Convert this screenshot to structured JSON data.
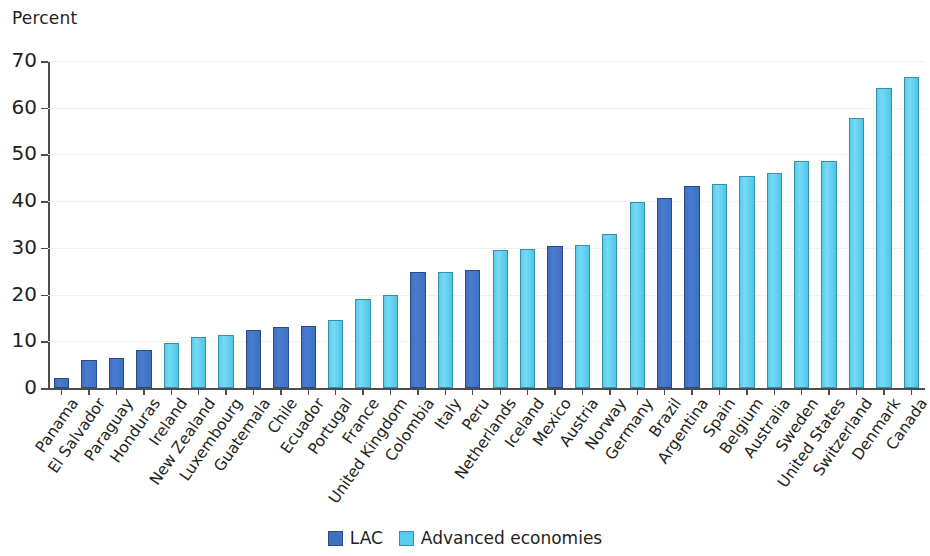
{
  "chart_data": {
    "type": "bar",
    "title": "",
    "subtitle": "",
    "xlabel": "",
    "ylabel": "Percent",
    "ylim": [
      0,
      70
    ],
    "yticks": [
      0,
      10,
      20,
      30,
      40,
      50,
      60,
      70
    ],
    "grid": true,
    "legend_position": "bottom-center",
    "categories": [
      "Panama",
      "El Salvador",
      "Paraguay",
      "Honduras",
      "Ireland",
      "New Zealand",
      "Luxembourg",
      "Guatemala",
      "Chile",
      "Ecuador",
      "Portugal",
      "France",
      "United Kingdom",
      "Colombia",
      "Italy",
      "Peru",
      "Netherlands",
      "Iceland",
      "Mexico",
      "Austria",
      "Norway",
      "Germany",
      "Brazil",
      "Argentina",
      "Spain",
      "Belgium",
      "Australia",
      "Sweden",
      "United States",
      "Switzerland",
      "Denmark",
      "Canada"
    ],
    "values": [
      2.1,
      6.0,
      6.4,
      8.1,
      9.7,
      10.9,
      11.3,
      12.5,
      13.1,
      13.3,
      14.5,
      19.0,
      20.0,
      24.8,
      24.9,
      25.3,
      29.6,
      29.7,
      30.5,
      30.7,
      32.9,
      39.8,
      40.7,
      43.2,
      43.7,
      45.3,
      46.1,
      48.7,
      48.7,
      57.9,
      64.2,
      66.5
    ],
    "groups": [
      "LAC",
      "LAC",
      "LAC",
      "LAC",
      "Advanced economies",
      "Advanced economies",
      "Advanced economies",
      "LAC",
      "LAC",
      "LAC",
      "Advanced economies",
      "Advanced economies",
      "Advanced economies",
      "LAC",
      "Advanced economies",
      "LAC",
      "Advanced economies",
      "Advanced economies",
      "LAC",
      "Advanced economies",
      "Advanced economies",
      "Advanced economies",
      "LAC",
      "LAC",
      "Advanced economies",
      "Advanced economies",
      "Advanced economies",
      "Advanced economies",
      "Advanced economies",
      "Advanced economies",
      "Advanced economies",
      "Advanced economies"
    ],
    "series": [
      {
        "name": "LAC",
        "color": "#3f6fc0",
        "points": [
          {
            "category": "Panama",
            "value": 2.1
          },
          {
            "category": "El Salvador",
            "value": 6.0
          },
          {
            "category": "Paraguay",
            "value": 6.4
          },
          {
            "category": "Honduras",
            "value": 8.1
          },
          {
            "category": "Guatemala",
            "value": 12.5
          },
          {
            "category": "Chile",
            "value": 13.1
          },
          {
            "category": "Ecuador",
            "value": 13.3
          },
          {
            "category": "Colombia",
            "value": 24.8
          },
          {
            "category": "Peru",
            "value": 25.3
          },
          {
            "category": "Mexico",
            "value": 30.5
          },
          {
            "category": "Brazil",
            "value": 40.7
          },
          {
            "category": "Argentina",
            "value": 43.2
          }
        ]
      },
      {
        "name": "Advanced economies",
        "color": "#57cdee",
        "points": [
          {
            "category": "Ireland",
            "value": 9.7
          },
          {
            "category": "New Zealand",
            "value": 10.9
          },
          {
            "category": "Luxembourg",
            "value": 11.3
          },
          {
            "category": "Portugal",
            "value": 14.5
          },
          {
            "category": "France",
            "value": 19.0
          },
          {
            "category": "United Kingdom",
            "value": 20.0
          },
          {
            "category": "Italy",
            "value": 24.9
          },
          {
            "category": "Netherlands",
            "value": 29.6
          },
          {
            "category": "Iceland",
            "value": 29.7
          },
          {
            "category": "Austria",
            "value": 30.7
          },
          {
            "category": "Norway",
            "value": 32.9
          },
          {
            "category": "Germany",
            "value": 39.8
          },
          {
            "category": "Spain",
            "value": 43.7
          },
          {
            "category": "Belgium",
            "value": 45.3
          },
          {
            "category": "Australia",
            "value": 46.1
          },
          {
            "category": "Sweden",
            "value": 48.7
          },
          {
            "category": "United States",
            "value": 48.7
          },
          {
            "category": "Switzerland",
            "value": 57.9
          },
          {
            "category": "Denmark",
            "value": 64.2
          },
          {
            "category": "Canada",
            "value": 66.5
          }
        ]
      }
    ]
  },
  "axis": {
    "unit_label": "Percent"
  },
  "legend": {
    "items": [
      {
        "label": "LAC",
        "color": "#3f6fc0",
        "key": "lac"
      },
      {
        "label": "Advanced economies",
        "color": "#57cdee",
        "key": "adv"
      }
    ]
  }
}
